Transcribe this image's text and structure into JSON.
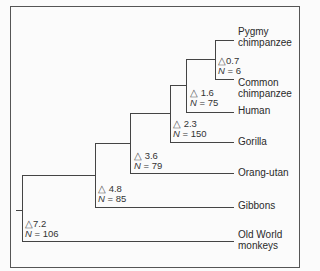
{
  "diagram": {
    "type": "phylogenetic-tree",
    "taxa": [
      {
        "id": "pygmy",
        "label_line1": "Pygmy",
        "label_line2": "chimpanzee"
      },
      {
        "id": "common",
        "label_line1": "Common",
        "label_line2": "chimpanzee"
      },
      {
        "id": "human",
        "label_line1": "Human"
      },
      {
        "id": "gorilla",
        "label_line1": "Gorilla"
      },
      {
        "id": "orang",
        "label_line1": "Orang-utan"
      },
      {
        "id": "gibbons",
        "label_line1": "Gibbons"
      },
      {
        "id": "owm",
        "label_line1": "Old World",
        "label_line2": "monkeys"
      }
    ],
    "nodes": [
      {
        "id": "n07",
        "delta_symbol": "△",
        "delta": "0.7",
        "n_label": "N",
        "n_value": "= 6"
      },
      {
        "id": "n16",
        "delta_symbol": "△",
        "delta": "1.6",
        "n_label": "N",
        "n_value": "= 75"
      },
      {
        "id": "n23",
        "delta_symbol": "△",
        "delta": "2.3",
        "n_label": "N",
        "n_value": "= 150"
      },
      {
        "id": "n36",
        "delta_symbol": "△",
        "delta": "3.6",
        "n_label": "N",
        "n_value": "= 79"
      },
      {
        "id": "n48",
        "delta_symbol": "△",
        "delta": "4.8",
        "n_label": "N",
        "n_value": "= 85"
      },
      {
        "id": "n72",
        "delta_symbol": "△",
        "delta": "7.2",
        "n_label": "N",
        "n_value": "= 106"
      }
    ]
  }
}
